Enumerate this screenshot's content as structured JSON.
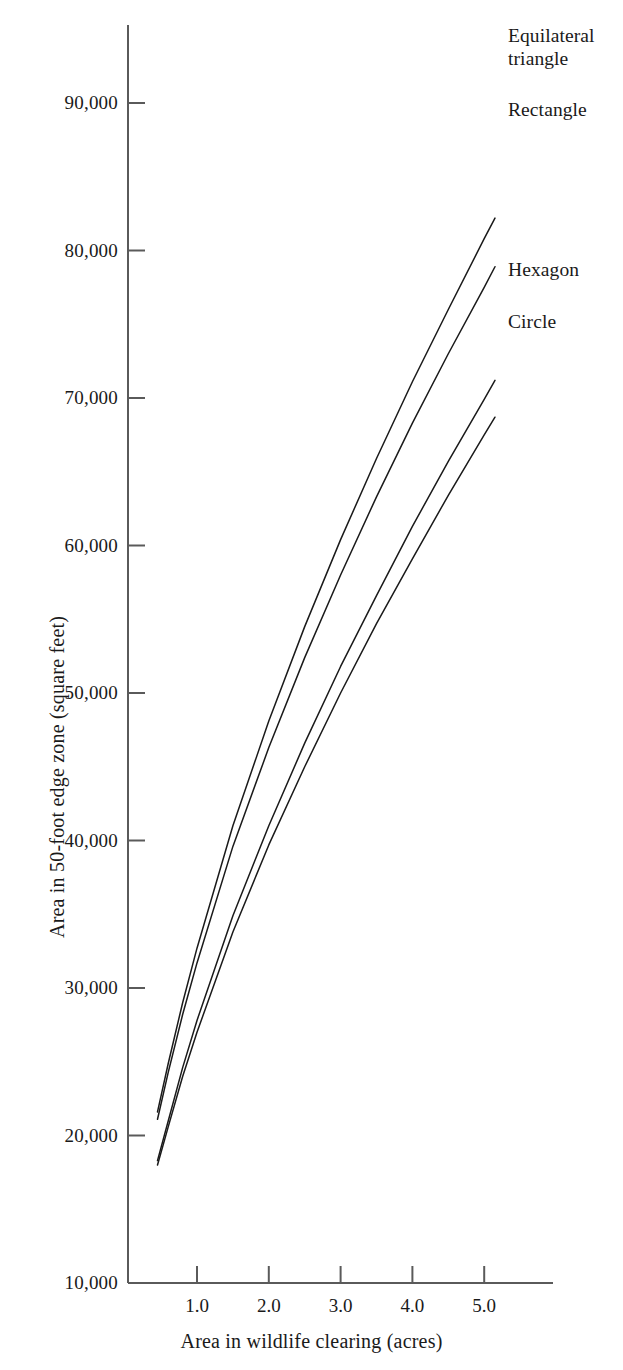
{
  "chart_data": {
    "type": "line",
    "title": "",
    "xlabel": "Area in wildlife clearing (acres)",
    "ylabel": "Area in 50-foot edge zone (square feet)",
    "xlim": [
      0.0,
      5.9
    ],
    "ylim": [
      10000,
      96000
    ],
    "grid": false,
    "legend_position": "right-of-curve-ends",
    "xticks": [
      1.0,
      2.0,
      3.0,
      4.0,
      5.0
    ],
    "xtick_labels": [
      "1.0",
      "2.0",
      "3.0",
      "4.0",
      "5.0"
    ],
    "yticks": [
      10000,
      20000,
      30000,
      40000,
      50000,
      60000,
      70000,
      80000,
      90000
    ],
    "ytick_labels": [
      "10,000",
      "20,000",
      "30,000",
      "40,000",
      "50,000",
      "60,000",
      "70,000",
      "80,000",
      "90,000"
    ],
    "x": [
      0.45,
      0.6,
      0.8,
      1.0,
      1.5,
      2.0,
      2.5,
      3.0,
      3.5,
      4.0,
      4.5,
      5.0,
      5.15
    ],
    "series": [
      {
        "name": "Equilateral triangle",
        "label": "Equilateral\ntriangle",
        "color": "#1a1a1a",
        "values": [
          21600,
          24900,
          29000,
          32700,
          41000,
          48100,
          54500,
          60400,
          65900,
          71100,
          76000,
          80800,
          82200
        ]
      },
      {
        "name": "Rectangle",
        "label": "Rectangle",
        "color": "#1a1a1a",
        "values": [
          21100,
          24300,
          28200,
          31700,
          39600,
          46300,
          52400,
          58000,
          63300,
          68300,
          73000,
          77500,
          78900
        ]
      },
      {
        "name": "Hexagon",
        "label": "Hexagon",
        "color": "#1a1a1a",
        "values": [
          18300,
          21000,
          24600,
          27800,
          34900,
          41000,
          46600,
          51800,
          56600,
          61300,
          65700,
          69900,
          71200
        ]
      },
      {
        "name": "Circle",
        "label": "Circle",
        "color": "#1a1a1a",
        "values": [
          18000,
          20600,
          24000,
          27000,
          33800,
          39700,
          45000,
          50000,
          54700,
          59100,
          63400,
          67500,
          68700
        ]
      }
    ]
  },
  "axes": {
    "y_title": "Area in 50-foot edge zone (square feet)",
    "x_title": "Area in wildlife clearing (acres)",
    "y_labels": [
      "90,000",
      "80,000",
      "70,000",
      "60,000",
      "50,000",
      "40,000",
      "30,000",
      "20,000",
      "10,000"
    ],
    "x_labels": [
      "1.0",
      "2.0",
      "3.0",
      "4.0",
      "5.0"
    ]
  },
  "labels": {
    "equilateral_triangle": "Equilateral\ntriangle",
    "rectangle": "Rectangle",
    "hexagon": "Hexagon",
    "circle": "Circle"
  },
  "style": {
    "line_color": "#1a1a1a",
    "axis_color": "#5a5a5a",
    "background": "#ffffff"
  }
}
